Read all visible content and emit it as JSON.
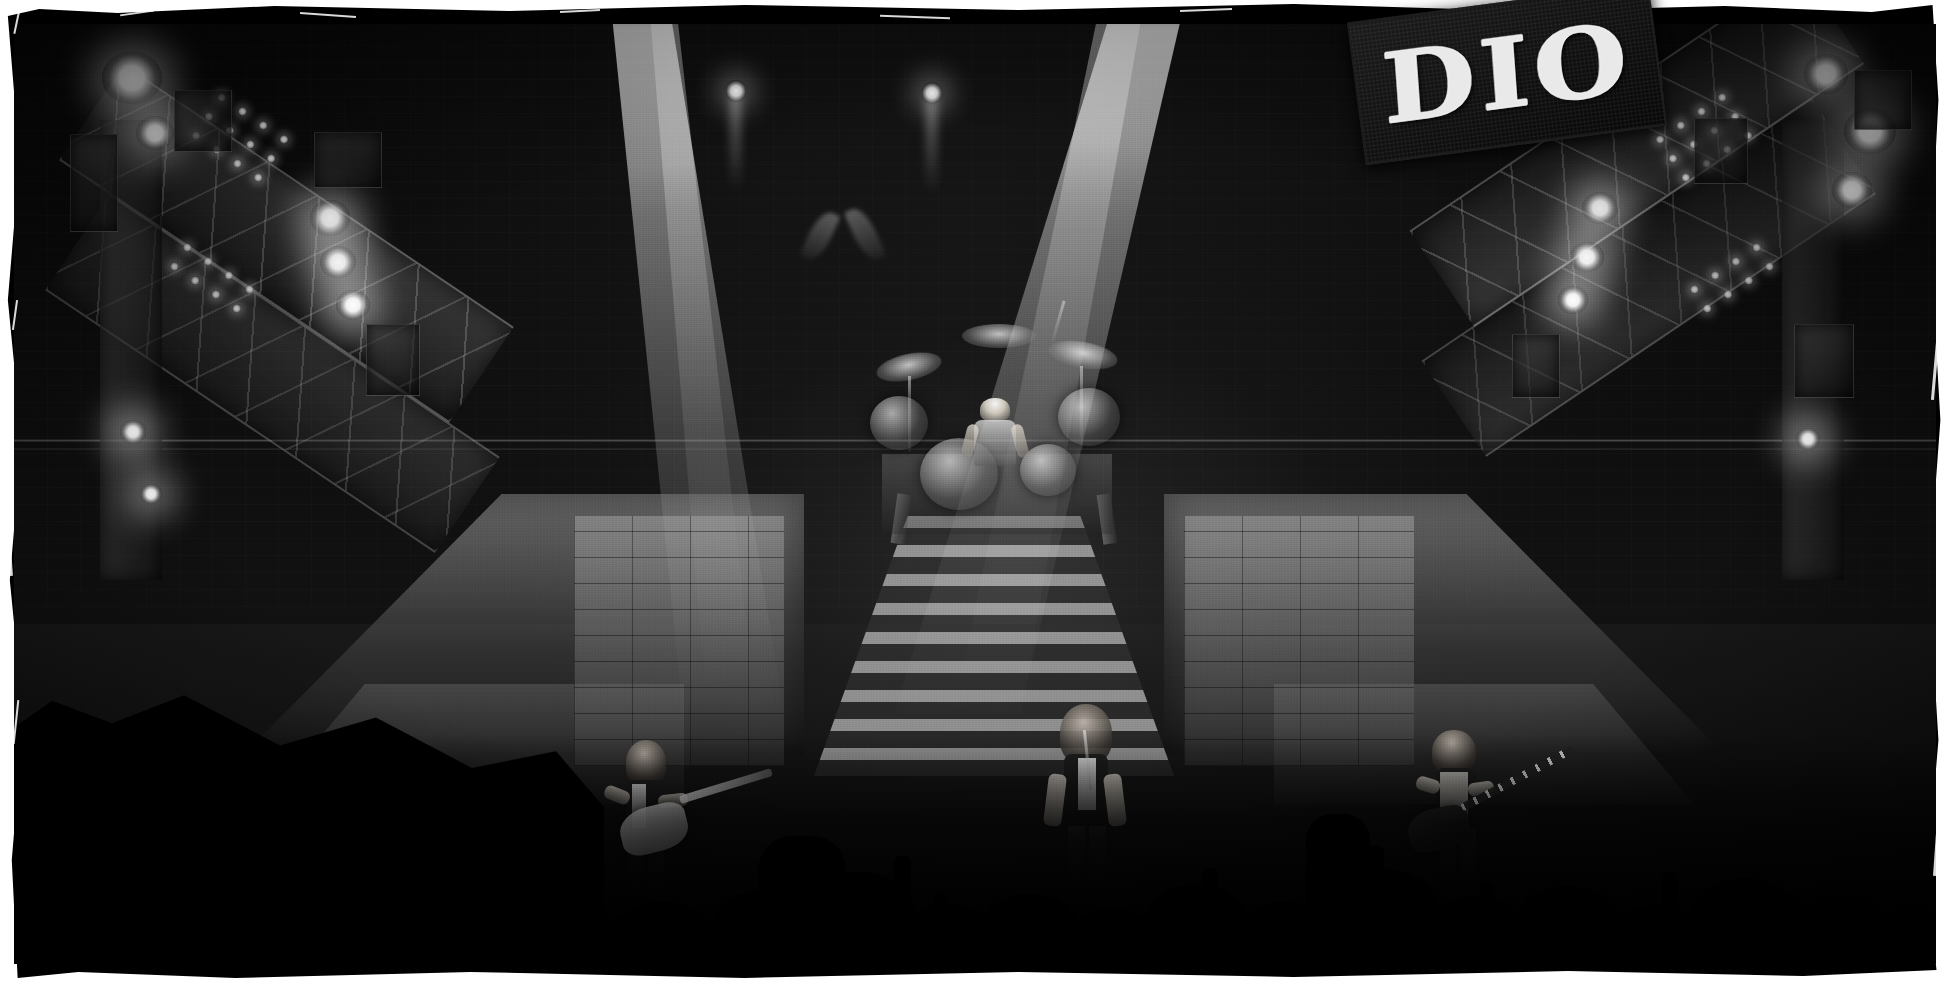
{
  "photo": {
    "title": "DIO live concert stage photograph",
    "medium": "black-and-white film print with torn border",
    "scene_caption": "Wide shot of a metal band performing on a large stage with a central staircase, drum riser, lighting trusses and a crowd in silhouette"
  },
  "banner": {
    "text": "DIO",
    "style": "blackletter gothic",
    "color_text": "#e9e9e9",
    "color_cloth": "#121212",
    "rotation_deg": -7.5
  },
  "stage": {
    "backdrop_color": "#0d0d0d",
    "beam_color": "#ffffff",
    "lamp_color": "#ffffff",
    "floor_color": "#6e6e6e",
    "labels": {
      "staircase": "center staircase",
      "drum_riser": "drum riser",
      "left_ramp": "left stage ramp",
      "right_ramp": "right stage ramp",
      "left_truss": "left lighting truss",
      "right_truss": "right lighting truss",
      "backdrop_eyes": "demon eyes backdrop motif"
    }
  },
  "performers": [
    {
      "role": "lead-guitarist",
      "position": "stage left",
      "instrument": "electric guitar",
      "guitar_color": "#f2f2f2"
    },
    {
      "role": "vocalist",
      "position": "center stage",
      "instrument": "microphone",
      "hair": "long dark curly"
    },
    {
      "role": "bassist",
      "position": "stage right",
      "instrument": "bass guitar",
      "guitar_color": "#1e1e1e"
    },
    {
      "role": "drummer",
      "position": "upstage riser",
      "instrument": "drum kit",
      "headband": "light headband"
    }
  ],
  "lighting": {
    "spot_beams": 2,
    "point_lamps": 2,
    "truss_lamp_rows": 3,
    "truss_lamp_cols": 4
  },
  "audience": {
    "description": "silhouetted crowd with raised hands and fists along the bottom edge",
    "head_count": 26,
    "raised_hand_count": 14
  },
  "border": {
    "frame_color": "#000000",
    "page_color": "#ffffff",
    "scratch_color": "#ffffff"
  }
}
